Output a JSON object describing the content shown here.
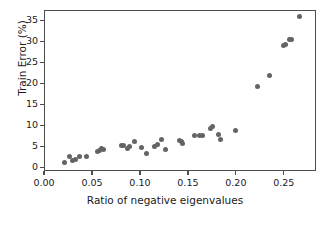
{
  "chart_data": {
    "type": "scatter",
    "title": "",
    "xlabel": "Ratio of negative eigenvalues",
    "ylabel": "Train Error (%)",
    "xlim": [
      0.0,
      0.2835
    ],
    "ylim": [
      -0.9,
      37.5
    ],
    "xticks": [
      0.0,
      0.05,
      0.1,
      0.15,
      0.2,
      0.25
    ],
    "xticklabels": [
      "0.00",
      "0.05",
      "0.10",
      "0.15",
      "0.20",
      "0.25"
    ],
    "yticks": [
      0,
      5,
      10,
      15,
      20,
      25,
      30,
      35
    ],
    "yticklabels": [
      "0",
      "5",
      "10",
      "15",
      "20",
      "25",
      "30",
      "35"
    ],
    "grid": false,
    "legend": null,
    "marker": {
      "shape": "circle",
      "color": "#646464",
      "size_px": 5
    },
    "series": [
      {
        "name": "train error vs ratio of negative eigenvalues",
        "color": "#646464",
        "points": [
          [
            0.0205,
            1.3
          ],
          [
            0.0255,
            2.9
          ],
          [
            0.0285,
            1.8
          ],
          [
            0.032,
            2.2
          ],
          [
            0.036,
            2.8
          ],
          [
            0.043,
            2.8
          ],
          [
            0.0545,
            4.1
          ],
          [
            0.057,
            4.3
          ],
          [
            0.059,
            4.6
          ],
          [
            0.061,
            4.4
          ],
          [
            0.0795,
            5.5
          ],
          [
            0.0815,
            5.4
          ],
          [
            0.0855,
            4.7
          ],
          [
            0.088,
            5.2
          ],
          [
            0.093,
            6.4
          ],
          [
            0.101,
            4.9
          ],
          [
            0.1055,
            3.6
          ],
          [
            0.1145,
            5.3
          ],
          [
            0.1175,
            5.6
          ],
          [
            0.121,
            6.9
          ],
          [
            0.1255,
            4.5
          ],
          [
            0.1405,
            6.6
          ],
          [
            0.1425,
            6.3
          ],
          [
            0.1435,
            6.0
          ],
          [
            0.1555,
            7.7
          ],
          [
            0.1615,
            7.9
          ],
          [
            0.164,
            7.9
          ],
          [
            0.1725,
            9.5
          ],
          [
            0.1745,
            10.0
          ],
          [
            0.1805,
            8.0
          ],
          [
            0.183,
            6.9
          ],
          [
            0.1985,
            9.0
          ],
          [
            0.221,
            19.4
          ],
          [
            0.234,
            22.1
          ],
          [
            0.249,
            29.2
          ],
          [
            0.2505,
            29.6
          ],
          [
            0.255,
            30.8
          ],
          [
            0.257,
            30.8
          ],
          [
            0.265,
            36.1
          ]
        ]
      }
    ]
  }
}
